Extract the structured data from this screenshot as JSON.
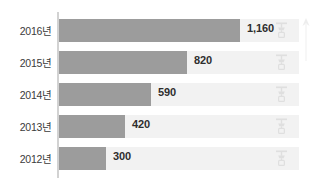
{
  "chart_data": {
    "type": "bar",
    "orientation": "horizontal",
    "title": "",
    "subtitle": "",
    "xlabel": "",
    "ylabel": "",
    "categories": [
      "2016년",
      "2015년",
      "2014년",
      "2013년",
      "2012년"
    ],
    "values": [
      1160,
      820,
      590,
      420,
      300
    ],
    "value_labels": [
      "1,160",
      "820",
      "590",
      "420",
      "300"
    ],
    "xlim": [
      0,
      1160
    ],
    "grid": false,
    "legend": null,
    "series": [
      {
        "name": "",
        "values": [
          1160,
          820,
          590,
          420,
          300
        ]
      }
    ],
    "annotations": []
  },
  "style": {
    "bar_color": "#9c9c9c",
    "track_color": "#f2f2f2",
    "axis_color": "#d2d2d2",
    "label_color": "#3b3b3b",
    "value_color": "#2e2e2e",
    "background": "#ffffff"
  },
  "watermarks": {
    "row_glyph_name": "faucet-watermark-icon",
    "edge_glyph_name": "up-arrow-watermark-icon",
    "count": 5
  }
}
